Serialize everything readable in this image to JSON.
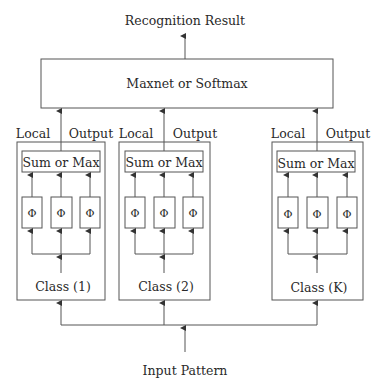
{
  "diagram": {
    "output_label": "Recognition Result",
    "top_box_label": "Maxnet or Softmax",
    "input_label": "Input Pattern",
    "modules": [
      {
        "local_label": "Local",
        "output_label": "Output",
        "combiner_label": "Sum or Max",
        "units": [
          "Φ",
          "Φ",
          "Φ"
        ],
        "class_label": "Class (1)"
      },
      {
        "local_label": "Local",
        "output_label": "Output",
        "combiner_label": "Sum or Max",
        "units": [
          "Φ",
          "Φ",
          "Φ"
        ],
        "class_label": "Class (2)"
      },
      {
        "local_label": "Local",
        "output_label": "Output",
        "combiner_label": "Sum or Max",
        "units": [
          "Φ",
          "Φ",
          "Φ"
        ],
        "class_label": "Class (K)"
      }
    ]
  },
  "colors": {
    "line": "#555555",
    "text": "#2a2a2a",
    "background": "#ffffff"
  }
}
